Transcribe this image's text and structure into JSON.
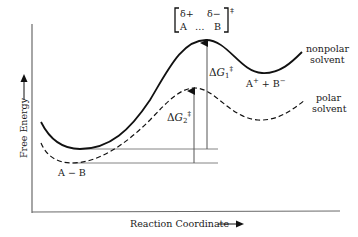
{
  "diagram": {
    "axes": {
      "y_label": "Free Energy",
      "x_label": "Reaction Coordinate"
    },
    "transition_state": {
      "top_left": "δ+",
      "top_right": "δ−",
      "bottom_left": "A",
      "dots": "…",
      "bottom_right": "B",
      "superscript": "‡"
    },
    "reactant_label": "A − B",
    "product_label": {
      "text": "A",
      "sup1": "+",
      "plus": " + B",
      "sup2": "−"
    },
    "curves": [
      {
        "name": "nonpolar",
        "label_line1": "nonpolar",
        "label_line2": "solvent",
        "style": "solid"
      },
      {
        "name": "polar",
        "label_line1": "polar",
        "label_line2": "solvent",
        "style": "dashed"
      }
    ],
    "barriers": [
      {
        "name": "delta-g1",
        "symbol": "ΔG",
        "subscript": "1",
        "superscript": "‡"
      },
      {
        "name": "delta-g2",
        "symbol": "ΔG",
        "subscript": "2",
        "superscript": "‡"
      }
    ],
    "colors": {
      "curve": "#111111",
      "axis": "#6a6a6a",
      "background": "#ffffff"
    }
  }
}
